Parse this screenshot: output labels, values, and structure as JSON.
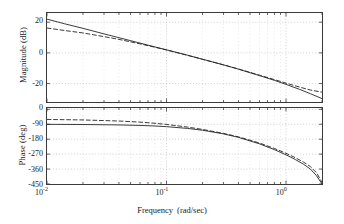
{
  "figure": {
    "kind": "bode-plot",
    "background": "#ffffff",
    "axis_color": "#3a3a3a",
    "grid_color": "#b8b8b8",
    "curve_color": "#222222"
  },
  "xaxis": {
    "label_text": "Frequency",
    "label_units": "(rad/sec)",
    "scale": "log",
    "limits": [
      0.01,
      2.0
    ],
    "tick_mantissa": "10",
    "ticks": [
      {
        "value": 0.01,
        "mantissa": "10",
        "exponent": "-2"
      },
      {
        "value": 0.1,
        "mantissa": "10",
        "exponent": "-1"
      },
      {
        "value": 1.0,
        "mantissa": "10",
        "exponent": "0"
      }
    ]
  },
  "magnitude_panel": {
    "ylabel": "Magnitude (dB)",
    "yticks": [
      "20",
      "0",
      "-20"
    ],
    "ytick_values": [
      20,
      0,
      -20
    ],
    "ylim": [
      -32,
      26
    ],
    "grid": "on"
  },
  "phase_panel": {
    "ylabel": "Phase (deg)",
    "yticks": [
      "0",
      "-90",
      "-180",
      "-270",
      "-360",
      "-450"
    ],
    "ytick_values": [
      0,
      -90,
      -180,
      -270,
      -360,
      -450
    ],
    "ylim": [
      -450,
      8
    ],
    "grid": "on"
  },
  "chart_data": {
    "type": "line",
    "title": "",
    "xlabel": "Frequency  (rad/sec)",
    "ylabel": "Magnitude (dB) / Phase (deg)",
    "xscale": "log",
    "xlim": [
      0.01,
      2.0
    ],
    "panels": [
      {
        "name": "magnitude",
        "ylabel": "Magnitude (dB)",
        "ylim": [
          -32,
          26
        ],
        "yticks": [
          20,
          0,
          -20
        ],
        "grid": true,
        "series": [
          {
            "name": "exact",
            "style": "solid",
            "x": [
              0.01,
              0.014,
              0.02,
              0.03,
              0.04,
              0.06,
              0.08,
              0.1,
              0.15,
              0.2,
              0.3,
              0.4,
              0.6,
              0.8,
              1.0,
              1.3,
              1.6,
              2.0
            ],
            "values": [
              22.0,
              19.0,
              16.0,
              12.4,
              9.9,
              6.4,
              3.9,
              2.0,
              -1.5,
              -4.1,
              -7.8,
              -10.6,
              -14.8,
              -17.9,
              -20.5,
              -23.8,
              -26.6,
              -29.8
            ]
          },
          {
            "name": "approximation",
            "style": "dashed",
            "x": [
              0.01,
              0.014,
              0.02,
              0.03,
              0.04,
              0.06,
              0.08,
              0.1,
              0.15,
              0.2,
              0.3,
              0.4,
              0.6,
              0.8,
              1.0,
              1.3,
              1.6,
              2.0
            ],
            "values": [
              16.2,
              14.6,
              13.0,
              10.6,
              8.8,
              5.9,
              3.7,
              1.9,
              -1.6,
              -4.2,
              -7.8,
              -10.5,
              -14.5,
              -17.4,
              -19.7,
              -22.3,
              -24.2,
              -25.6
            ]
          }
        ]
      },
      {
        "name": "phase",
        "ylabel": "Phase (deg)",
        "ylim": [
          -450,
          8
        ],
        "yticks": [
          0,
          -90,
          -180,
          -270,
          -360,
          -450
        ],
        "grid": true,
        "series": [
          {
            "name": "exact",
            "style": "solid",
            "x": [
              0.01,
              0.02,
              0.04,
              0.06,
              0.08,
              0.1,
              0.15,
              0.2,
              0.3,
              0.4,
              0.6,
              0.8,
              1.0,
              1.2,
              1.4,
              1.6,
              1.8,
              2.0
            ],
            "values": [
              -90.5,
              -91.5,
              -94.0,
              -97.0,
              -100.5,
              -104.5,
              -115.0,
              -126.0,
              -148.0,
              -169.0,
              -208.0,
              -243.0,
              -274.0,
              -303.0,
              -331.0,
              -360.0,
              -400.0,
              -450.0
            ]
          },
          {
            "name": "approximation",
            "style": "dashed",
            "x": [
              0.01,
              0.02,
              0.04,
              0.06,
              0.08,
              0.1,
              0.15,
              0.2,
              0.3,
              0.4,
              0.6,
              0.8,
              1.0,
              1.2,
              1.4,
              1.6,
              1.8,
              2.0
            ],
            "values": [
              -61.0,
              -64.0,
              -70.5,
              -77.0,
              -84.0,
              -91.0,
              -107.0,
              -121.0,
              -145.0,
              -166.0,
              -203.0,
              -236.0,
              -265.0,
              -292.0,
              -318.0,
              -345.0,
              -382.0,
              -440.0
            ]
          }
        ]
      }
    ]
  }
}
